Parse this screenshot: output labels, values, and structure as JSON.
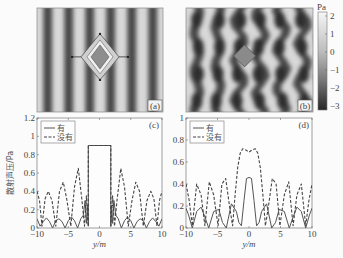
{
  "figure": {
    "width": 343,
    "height": 258,
    "background": "#fbfbfb"
  },
  "panels": {
    "a": {
      "label": "(a)",
      "type": "field_map",
      "x": 37,
      "y": 8,
      "w": 126,
      "h": 104,
      "scatterer": "diamond-with-cloak",
      "stripes": 6
    },
    "b": {
      "label": "(b)",
      "type": "field_map",
      "x": 186,
      "y": 8,
      "w": 127,
      "h": 104,
      "scatterer": "bare-diamond",
      "stripes": 6
    },
    "c": {
      "label": "(c)",
      "x": 37,
      "y": 118,
      "w": 125,
      "h": 110
    },
    "d": {
      "label": "(d)",
      "x": 186,
      "y": 118,
      "w": 126,
      "h": 110
    }
  },
  "colorbar": {
    "unit": "Pa",
    "ticks": [
      "2",
      "1",
      "0",
      "−1",
      "−2",
      "−3"
    ],
    "values": [
      2,
      1,
      0,
      -1,
      -2,
      -3
    ],
    "x": 318,
    "y": 12,
    "w": 9,
    "h": 98,
    "color_light": "#f2f2f2",
    "color_dark": "#2e2e2e"
  },
  "legend": {
    "solid_label": "有",
    "dashed_label": "没有"
  },
  "chart_data": [
    {
      "panel": "c",
      "type": "line",
      "title": "",
      "xlabel": "y/m",
      "ylabel": "散射声压/Pa",
      "xlim": [
        -10,
        10
      ],
      "ylim": [
        0,
        1.2
      ],
      "xticks": [
        "−10",
        "−5",
        "0",
        "5",
        "10"
      ],
      "yticks": [
        "0",
        "0.2",
        "0.4",
        "0.6",
        "0.8",
        "1",
        "1.2"
      ],
      "grid": false,
      "legend_position": "upper-left",
      "series": [
        {
          "name": "有",
          "style": "solid",
          "x": [
            -10,
            -9.5,
            -9,
            -8.5,
            -8,
            -7.5,
            -7,
            -6.5,
            -6,
            -5.5,
            -5,
            -4.5,
            -4,
            -3.5,
            -3,
            -2.6,
            -2.3,
            -2.1,
            -1.9,
            -1.8,
            -1.8,
            1.8,
            1.8,
            1.9,
            2.1,
            2.3,
            2.6,
            3,
            3.5,
            4,
            4.5,
            5,
            5.5,
            6,
            6.5,
            7,
            7.5,
            8,
            8.5,
            9,
            9.5,
            10
          ],
          "y": [
            0.1,
            0.02,
            0.07,
            0.11,
            0.07,
            0.0,
            0.08,
            0.1,
            0.07,
            0.0,
            0.08,
            0.12,
            0.08,
            0.0,
            0.1,
            0.14,
            0.3,
            0.05,
            0.25,
            0.02,
            0.9,
            0.9,
            0.02,
            0.25,
            0.05,
            0.3,
            0.14,
            0.1,
            0.0,
            0.08,
            0.12,
            0.08,
            0.0,
            0.07,
            0.1,
            0.08,
            0.0,
            0.07,
            0.11,
            0.07,
            0.02,
            0.1
          ]
        },
        {
          "name": "没有",
          "style": "dashed",
          "x": [
            -10,
            -9.6,
            -9.2,
            -8.7,
            -8.2,
            -7.6,
            -7.0,
            -6.4,
            -5.8,
            -5.2,
            -4.6,
            -4.0,
            -3.4,
            -2.8,
            -2.4,
            -2.1,
            -1.9,
            -1.8,
            -1.8,
            1.8,
            1.8,
            1.9,
            2.1,
            2.4,
            2.8,
            3.4,
            4.0,
            4.6,
            5.2,
            5.8,
            6.4,
            7.0,
            7.6,
            8.2,
            8.7,
            9.2,
            9.6,
            10
          ],
          "y": [
            0.4,
            0.3,
            0.02,
            0.32,
            0.4,
            0.3,
            0.02,
            0.4,
            0.5,
            0.3,
            0.02,
            0.45,
            0.65,
            0.3,
            0.02,
            0.35,
            0.1,
            0.02,
            0.9,
            0.9,
            0.02,
            0.1,
            0.35,
            0.02,
            0.3,
            0.65,
            0.45,
            0.02,
            0.3,
            0.5,
            0.4,
            0.02,
            0.3,
            0.4,
            0.32,
            0.02,
            0.3,
            0.4
          ]
        }
      ]
    },
    {
      "panel": "d",
      "type": "line",
      "title": "",
      "xlabel": "y/m",
      "ylabel": "",
      "xlim": [
        -10,
        10
      ],
      "ylim": [
        0,
        1
      ],
      "xticks": [
        "−10",
        "−5",
        "0",
        "5",
        "10"
      ],
      "yticks": [
        "0",
        "0.2",
        "0.4",
        "0.6",
        "0.8",
        "1"
      ],
      "grid": false,
      "legend_position": "upper-left",
      "series": [
        {
          "name": "有",
          "style": "solid",
          "x": [
            -10,
            -9.6,
            -9.0,
            -8.3,
            -7.6,
            -7.0,
            -6.4,
            -5.6,
            -4.8,
            -4.2,
            -3.6,
            -2.8,
            -2.0,
            -1.6,
            -1.2,
            -0.8,
            -0.4,
            0,
            0.4,
            0.8,
            1.2,
            1.6,
            2.0,
            2.8,
            3.6,
            4.2,
            4.8,
            5.6,
            6.4,
            7.0,
            7.6,
            8.3,
            9.0,
            9.6,
            10
          ],
          "y": [
            0.18,
            0.12,
            0.0,
            0.15,
            0.19,
            0.1,
            0.0,
            0.15,
            0.17,
            0.05,
            0.0,
            0.22,
            0.15,
            0.05,
            0.02,
            0.25,
            0.45,
            0.46,
            0.45,
            0.25,
            0.02,
            0.05,
            0.15,
            0.22,
            0.0,
            0.05,
            0.17,
            0.15,
            0.0,
            0.1,
            0.19,
            0.15,
            0.0,
            0.12,
            0.18
          ]
        },
        {
          "name": "没有",
          "style": "dashed",
          "x": [
            -10,
            -9.5,
            -9.0,
            -8.3,
            -7.6,
            -7.0,
            -6.3,
            -5.6,
            -4.9,
            -4.3,
            -3.7,
            -3.1,
            -2.6,
            -2.2,
            -1.8,
            -1.4,
            -1.0,
            -0.5,
            0,
            0.5,
            1.0,
            1.4,
            1.8,
            2.2,
            2.6,
            3.1,
            3.7,
            4.3,
            4.9,
            5.6,
            6.3,
            7.0,
            7.6,
            8.3,
            9.0,
            9.5,
            10
          ],
          "y": [
            0.4,
            0.25,
            0.02,
            0.4,
            0.3,
            0.02,
            0.42,
            0.3,
            0.02,
            0.4,
            0.45,
            0.2,
            0.02,
            0.3,
            0.55,
            0.68,
            0.72,
            0.71,
            0.69,
            0.71,
            0.72,
            0.68,
            0.55,
            0.3,
            0.02,
            0.2,
            0.45,
            0.4,
            0.02,
            0.3,
            0.42,
            0.02,
            0.3,
            0.4,
            0.02,
            0.25,
            0.4
          ]
        }
      ]
    }
  ]
}
